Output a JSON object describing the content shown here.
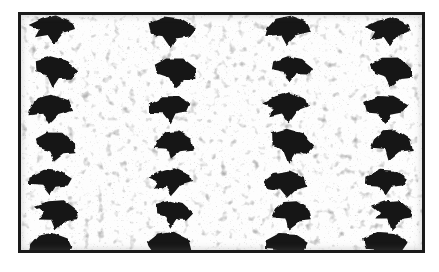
{
  "figure": {
    "kind": "micrograph",
    "caption": "",
    "frame": {
      "border_color": "#1a1a1a",
      "border_width_px": 3,
      "left": 18,
      "top": 12,
      "width": 407,
      "height": 241
    },
    "background": {
      "plate_color": "#fdfdfd",
      "page_color": "#ffffff",
      "speckle_color": "#3a3a3a",
      "speckle_count": 220
    },
    "features": {
      "label": "dark arrowhead-shaped particles",
      "fill_color": "#141414",
      "columns": 4,
      "rows": 7,
      "count": 28,
      "column_x": [
        52,
        172,
        288,
        388
      ],
      "row_y": [
        30,
        72,
        110,
        146,
        183,
        215,
        243
      ],
      "note": "regular grid array of irregular wedge/arrowhead particles; left and bottom edge particles are clipped by the frame"
    },
    "particles": [
      {
        "cx": 52,
        "cy": 30,
        "w": 46,
        "h": 30,
        "rot": -4,
        "variant": 0
      },
      {
        "cx": 56,
        "cy": 72,
        "w": 44,
        "h": 33,
        "rot": 5,
        "variant": 1
      },
      {
        "cx": 50,
        "cy": 110,
        "w": 44,
        "h": 30,
        "rot": -6,
        "variant": 2
      },
      {
        "cx": 56,
        "cy": 146,
        "w": 42,
        "h": 32,
        "rot": 8,
        "variant": 3
      },
      {
        "cx": 50,
        "cy": 183,
        "w": 44,
        "h": 28,
        "rot": -3,
        "variant": 4
      },
      {
        "cx": 56,
        "cy": 215,
        "w": 44,
        "h": 32,
        "rot": 6,
        "variant": 0
      },
      {
        "cx": 50,
        "cy": 248,
        "w": 44,
        "h": 30,
        "rot": -5,
        "variant": 2
      },
      {
        "cx": 172,
        "cy": 32,
        "w": 48,
        "h": 32,
        "rot": -2,
        "variant": 1
      },
      {
        "cx": 176,
        "cy": 72,
        "w": 44,
        "h": 32,
        "rot": 7,
        "variant": 3
      },
      {
        "cx": 170,
        "cy": 110,
        "w": 42,
        "h": 30,
        "rot": -7,
        "variant": 4
      },
      {
        "cx": 174,
        "cy": 146,
        "w": 40,
        "h": 30,
        "rot": 3,
        "variant": 2
      },
      {
        "cx": 170,
        "cy": 182,
        "w": 44,
        "h": 28,
        "rot": -4,
        "variant": 0
      },
      {
        "cx": 174,
        "cy": 214,
        "w": 38,
        "h": 28,
        "rot": 5,
        "variant": 1
      },
      {
        "cx": 170,
        "cy": 246,
        "w": 46,
        "h": 32,
        "rot": -3,
        "variant": 3
      },
      {
        "cx": 288,
        "cy": 31,
        "w": 46,
        "h": 30,
        "rot": -5,
        "variant": 2
      },
      {
        "cx": 292,
        "cy": 70,
        "w": 42,
        "h": 28,
        "rot": 4,
        "variant": 4
      },
      {
        "cx": 286,
        "cy": 108,
        "w": 46,
        "h": 32,
        "rot": -6,
        "variant": 0
      },
      {
        "cx": 292,
        "cy": 146,
        "w": 44,
        "h": 36,
        "rot": 6,
        "variant": 1
      },
      {
        "cx": 286,
        "cy": 184,
        "w": 44,
        "h": 28,
        "rot": -3,
        "variant": 3
      },
      {
        "cx": 292,
        "cy": 216,
        "w": 40,
        "h": 30,
        "rot": 5,
        "variant": 2
      },
      {
        "cx": 286,
        "cy": 247,
        "w": 44,
        "h": 30,
        "rot": -4,
        "variant": 4
      },
      {
        "cx": 388,
        "cy": 32,
        "w": 46,
        "h": 30,
        "rot": -4,
        "variant": 0
      },
      {
        "cx": 392,
        "cy": 71,
        "w": 44,
        "h": 32,
        "rot": 6,
        "variant": 3
      },
      {
        "cx": 386,
        "cy": 109,
        "w": 46,
        "h": 30,
        "rot": -5,
        "variant": 1
      },
      {
        "cx": 392,
        "cy": 146,
        "w": 42,
        "h": 32,
        "rot": 4,
        "variant": 2
      },
      {
        "cx": 386,
        "cy": 183,
        "w": 44,
        "h": 28,
        "rot": -3,
        "variant": 4
      },
      {
        "cx": 392,
        "cy": 215,
        "w": 42,
        "h": 32,
        "rot": 7,
        "variant": 0
      },
      {
        "cx": 386,
        "cy": 246,
        "w": 46,
        "h": 32,
        "rot": -5,
        "variant": 1
      }
    ]
  }
}
